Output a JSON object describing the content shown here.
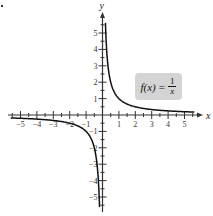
{
  "chart_data": {
    "type": "line",
    "title": "",
    "function_label": {
      "lhs": "f(x)",
      "equals": "=",
      "numerator": "1",
      "denominator": "x"
    },
    "xlabel": "x",
    "ylabel": "y",
    "xlim": [
      -5.7,
      5.7
    ],
    "ylim": [
      -5.7,
      5.7
    ],
    "x_ticks": [
      "-5",
      "-4",
      "-3",
      "-2",
      "-1",
      "1",
      "2",
      "3",
      "4",
      "5"
    ],
    "y_ticks": [
      "-5",
      "-4",
      "-3",
      "-2",
      "-1",
      "1",
      "2",
      "3",
      "4",
      "5"
    ],
    "grid": false,
    "legend": "boxed label at upper right",
    "series": [
      {
        "name": "f(x) = 1/x (x > 0)",
        "x": [
          0.18,
          0.25,
          0.5,
          1,
          2,
          3,
          4,
          5,
          5.6
        ],
        "y": [
          5.6,
          4,
          2,
          1,
          0.5,
          0.333,
          0.25,
          0.2,
          0.18
        ]
      },
      {
        "name": "f(x) = 1/x (x < 0)",
        "x": [
          -5.6,
          -5,
          -4,
          -3,
          -2,
          -1,
          -0.5,
          -0.25,
          -0.18
        ],
        "y": [
          -0.18,
          -0.2,
          -0.25,
          -0.333,
          -0.5,
          -1,
          -2,
          -4,
          -5.6
        ]
      }
    ],
    "colors": {
      "curve": "#111111",
      "axes": "#333333",
      "label_box": "#d4d4d4"
    }
  }
}
